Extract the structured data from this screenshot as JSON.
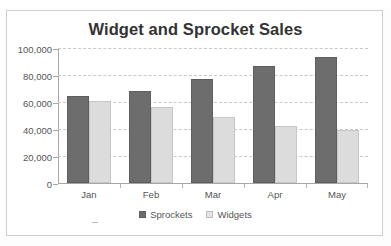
{
  "chart_data": {
    "type": "bar",
    "title": "Widget and Sprocket Sales",
    "xlabel": "",
    "ylabel": "",
    "categories": [
      "Jan",
      "Feb",
      "Mar",
      "Apr",
      "May"
    ],
    "series": [
      {
        "name": "Sprockets",
        "color": "#6d6d6d",
        "values": [
          64500,
          68000,
          77000,
          87000,
          93000
        ]
      },
      {
        "name": "Widgets",
        "color": "#dcdcdc",
        "values": [
          61000,
          56500,
          49000,
          42500,
          39000
        ]
      }
    ],
    "ylim": [
      0,
      100000
    ],
    "y_tick_values": [
      0,
      20000,
      40000,
      60000,
      80000,
      100000
    ],
    "y_tick_labels": [
      "0",
      "20,000",
      "40,000",
      "60,000",
      "80,000",
      "100,000"
    ],
    "grid": true,
    "legend_position": "bottom",
    "legend_entries": [
      "Sprockets",
      "Widgets"
    ]
  },
  "colors": {
    "sprockets": "#6d6d6d",
    "widgets": "#dcdcdc",
    "gridline": "#c9c9c9",
    "axis": "#a6a6a6",
    "title_text": "#333333",
    "label_text": "#555555",
    "frame_border": "#cfcfcf"
  }
}
